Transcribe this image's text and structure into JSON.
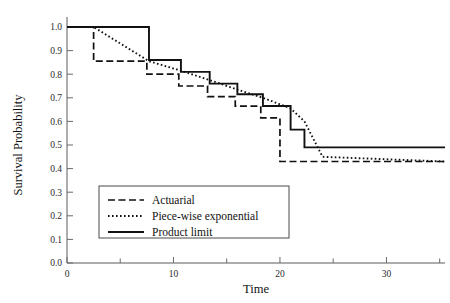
{
  "chart_data": {
    "type": "line",
    "title": "",
    "xlabel": "Time",
    "ylabel": "Survival Probability",
    "xlim": [
      0,
      35.5
    ],
    "ylim": [
      0.0,
      1.0
    ],
    "grid": false,
    "legend_position": "lower-left-inside",
    "x_ticks_major": [
      0,
      10,
      20,
      30
    ],
    "x_tick_labels": [
      "0",
      "10",
      "20",
      "30"
    ],
    "x_ticks_minor": [
      5,
      15,
      25,
      35
    ],
    "y_ticks": [
      0.0,
      0.1,
      0.2,
      0.3,
      0.4,
      0.5,
      0.6,
      0.7,
      0.8,
      0.9,
      1.0
    ],
    "y_tick_labels": [
      "0.0",
      "0.1",
      "0.2",
      "0.3",
      "0.4",
      "0.5",
      "0.6",
      "0.7",
      "0.8",
      "0.9",
      "1.0"
    ],
    "series": [
      {
        "name": "Actuarial",
        "style": "dashed",
        "step": "post",
        "x": [
          0,
          2.5,
          2.5,
          7.5,
          7.5,
          10.5,
          10.5,
          13.2,
          13.2,
          15.8,
          15.8,
          18.2,
          18.2,
          20.0,
          20.0,
          35.5
        ],
        "y": [
          1.0,
          1.0,
          0.855,
          0.855,
          0.8,
          0.8,
          0.75,
          0.75,
          0.705,
          0.705,
          0.665,
          0.665,
          0.615,
          0.615,
          0.43,
          0.43
        ]
      },
      {
        "name": "Piece-wise exponential",
        "style": "dotted",
        "step": "none",
        "x": [
          0,
          2.5,
          7.7,
          10.7,
          13.4,
          16.0,
          18.4,
          21.0,
          22.3,
          24.0,
          35.5
        ],
        "y": [
          1.0,
          1.0,
          0.855,
          0.815,
          0.775,
          0.735,
          0.7,
          0.655,
          0.6,
          0.45,
          0.43
        ]
      },
      {
        "name": "Product limit",
        "style": "solid",
        "step": "post",
        "x": [
          0,
          7.7,
          7.7,
          10.7,
          10.7,
          13.4,
          13.4,
          16.0,
          16.0,
          18.4,
          18.4,
          21.0,
          21.0,
          22.3,
          22.3,
          35.5
        ],
        "y": [
          1.0,
          1.0,
          0.86,
          0.86,
          0.81,
          0.81,
          0.76,
          0.76,
          0.715,
          0.715,
          0.665,
          0.665,
          0.565,
          0.565,
          0.49,
          0.49
        ]
      }
    ]
  },
  "legend": {
    "entries": [
      {
        "label": "Actuarial",
        "style": "dashed"
      },
      {
        "label": "Piece-wise exponential",
        "style": "dotted"
      },
      {
        "label": "Product limit",
        "style": "solid"
      }
    ]
  },
  "axes": {
    "y_title": "Survival Probability",
    "x_title": "Time"
  }
}
